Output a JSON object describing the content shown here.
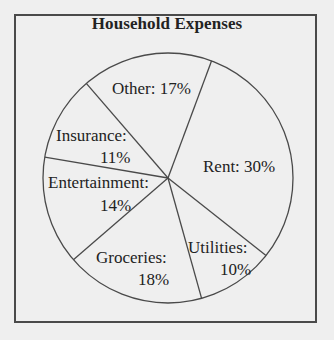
{
  "chart_data": {
    "type": "pie",
    "title": "Household Expenses",
    "categories": [
      "Rent",
      "Utilities",
      "Groceries",
      "Entertainment",
      "Insurance",
      "Other"
    ],
    "values": [
      30,
      10,
      18,
      14,
      11,
      17
    ],
    "unit": "%",
    "start_angle_deg": 20.4,
    "direction": "clockwise",
    "legend": "none",
    "labels": [
      {
        "name": "Rent: 30%"
      },
      {
        "name": "Utilities:",
        "value": "10%"
      },
      {
        "name": "Groceries:",
        "value": "18%"
      },
      {
        "name": "Entertainment:",
        "value": "14%"
      },
      {
        "name": "Insurance:",
        "value": "11%"
      },
      {
        "name": "Other: 17%"
      }
    ]
  },
  "colors": {
    "background": "#efefef",
    "stroke": "#4a4a4a",
    "text": "#222222"
  }
}
